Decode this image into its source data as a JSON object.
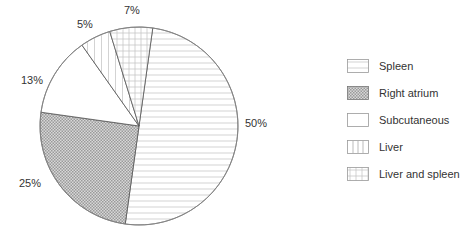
{
  "chart_data": {
    "type": "pie",
    "title": "",
    "categories": [
      "Spleen",
      "Right atrium",
      "Subcutaneous",
      "Liver",
      "Liver and spleen"
    ],
    "values": [
      50,
      25,
      13,
      5,
      7
    ],
    "labels": [
      "50%",
      "25%",
      "13%",
      "5%",
      "7%"
    ],
    "patterns": [
      "horizontal-lines",
      "dense-crosshatch",
      "blank",
      "vertical-lines",
      "grid"
    ],
    "legend_position": "right"
  },
  "slice_labels": {
    "spleen": "50%",
    "right_atrium": "25%",
    "subcutaneous": "13%",
    "liver": "5%",
    "liver_and_spleen": "7%"
  },
  "legend": {
    "items": [
      {
        "label": "Spleen",
        "pattern": "horizontal-lines"
      },
      {
        "label": "Right atrium",
        "pattern": "dense-crosshatch"
      },
      {
        "label": "Subcutaneous",
        "pattern": "blank"
      },
      {
        "label": "Liver",
        "pattern": "vertical-lines"
      },
      {
        "label": "Liver and spleen",
        "pattern": "grid"
      }
    ]
  }
}
